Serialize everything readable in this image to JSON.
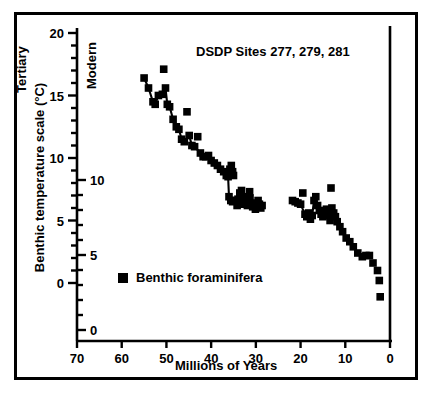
{
  "figure": {
    "title": "DSDP Sites 277, 279, 281",
    "xlabel": "Millions of Years",
    "ylabel": "Benthic temperature scale (°C)",
    "left_era_label": "Tertiary",
    "right_era_label": "Modern",
    "legend_label": "Benthic foraminifera",
    "legend_marker": "filled-square",
    "colors": {
      "ink": "#000000",
      "background": "#ffffff"
    }
  },
  "chart_data": {
    "type": "scatter",
    "title": "DSDP Sites 277, 279, 281",
    "xlabel": "Millions of Years",
    "ylabel": "Benthic temperature scale (°C)",
    "xlim": [
      70,
      0
    ],
    "x_reversed": true,
    "xticks": [
      70,
      60,
      50,
      40,
      30,
      20,
      10,
      0
    ],
    "xticklabels": [
      "70",
      "60",
      "50",
      "40",
      "30",
      "20",
      "10",
      "0"
    ],
    "grid": false,
    "legend_position": "inside-lower-left",
    "annotations": [
      "Tertiary",
      "Modern"
    ],
    "y_axes": [
      {
        "name": "upper-scale",
        "ticks": [
          20,
          15,
          10,
          5,
          0
        ],
        "ticklabels": [
          "20",
          "15",
          "10",
          "5",
          "0"
        ],
        "minor_tick_step": 1,
        "label_side": "left-of-axis",
        "pixel_top_value": 20,
        "pixel_bottom_value": 0
      },
      {
        "name": "lower-scale",
        "ticks": [
          10,
          5,
          0
        ],
        "ticklabels": [
          "10",
          "5",
          "0"
        ],
        "minor_tick_step": 1,
        "label_side": "right-of-axis",
        "pixel_top_value": 10,
        "pixel_bottom_value": 0
      }
    ],
    "series": [
      {
        "name": "Benthic foraminifera",
        "marker": "square",
        "color": "#000000",
        "connected": true,
        "points": [
          [
            55.0,
            16.4
          ],
          [
            54.0,
            15.6
          ],
          [
            53.0,
            14.5
          ],
          [
            52.5,
            14.3
          ],
          [
            51.8,
            15.0
          ],
          [
            50.9,
            15.1
          ],
          [
            50.6,
            17.1
          ],
          [
            50.2,
            15.6
          ],
          [
            49.8,
            14.3
          ],
          [
            49.3,
            14.1
          ],
          [
            48.5,
            13.1
          ],
          [
            47.8,
            12.5
          ],
          [
            47.2,
            12.3
          ],
          [
            46.6,
            11.5
          ],
          [
            46.0,
            11.3
          ],
          [
            45.4,
            13.7
          ],
          [
            44.9,
            11.8
          ],
          [
            44.3,
            11.0
          ],
          [
            43.7,
            10.9
          ],
          [
            43.0,
            11.7
          ],
          [
            42.4,
            10.4
          ],
          [
            41.8,
            10.1
          ],
          [
            41.2,
            10.1
          ],
          [
            40.6,
            10.2
          ],
          [
            40.0,
            9.8
          ],
          [
            39.3,
            9.6
          ],
          [
            38.6,
            9.4
          ],
          [
            37.9,
            9.1
          ],
          [
            37.2,
            8.9
          ],
          [
            36.6,
            8.6
          ],
          [
            36.2,
            8.5
          ],
          [
            35.8,
            9.1
          ],
          [
            35.5,
            9.4
          ],
          [
            35.2,
            8.9
          ],
          [
            35.0,
            8.6
          ],
          [
            36.0,
            6.9
          ],
          [
            35.6,
            6.6
          ],
          [
            35.2,
            6.5
          ],
          [
            34.6,
            6.6
          ],
          [
            34.0,
            6.7
          ],
          [
            33.6,
            7.2
          ],
          [
            33.2,
            7.4
          ],
          [
            32.8,
            6.9
          ],
          [
            32.5,
            6.6
          ],
          [
            32.2,
            6.4
          ],
          [
            31.9,
            6.2
          ],
          [
            31.6,
            6.5
          ],
          [
            31.3,
            6.8
          ],
          [
            31.0,
            6.4
          ],
          [
            30.7,
            6.1
          ],
          [
            30.4,
            6.3
          ],
          [
            30.1,
            5.9
          ],
          [
            29.8,
            6.2
          ],
          [
            29.5,
            6.6
          ],
          [
            29.2,
            6.3
          ],
          [
            28.9,
            6.0
          ],
          [
            28.6,
            6.2
          ],
          [
            31.4,
            7.3
          ],
          [
            33.0,
            6.3
          ],
          [
            34.2,
            6.2
          ],
          [
            21.8,
            6.6
          ],
          [
            21.2,
            6.5
          ],
          [
            20.6,
            6.4
          ],
          [
            20.0,
            6.3
          ],
          [
            19.5,
            7.2
          ],
          [
            19.0,
            5.5
          ],
          [
            18.6,
            5.3
          ],
          [
            18.2,
            5.6
          ],
          [
            17.8,
            5.1
          ],
          [
            17.4,
            5.4
          ],
          [
            17.0,
            6.6
          ],
          [
            16.6,
            6.9
          ],
          [
            16.2,
            6.2
          ],
          [
            15.8,
            5.8
          ],
          [
            15.4,
            5.5
          ],
          [
            15.0,
            5.3
          ],
          [
            14.6,
            5.6
          ],
          [
            14.2,
            5.9
          ],
          [
            13.8,
            5.4
          ],
          [
            13.4,
            5.0
          ],
          [
            13.2,
            7.6
          ],
          [
            13.0,
            6.0
          ],
          [
            12.6,
            5.6
          ],
          [
            12.2,
            5.3
          ],
          [
            11.8,
            4.9
          ],
          [
            11.2,
            4.5
          ],
          [
            10.6,
            4.1
          ],
          [
            9.8,
            3.6
          ],
          [
            9.0,
            3.3
          ],
          [
            8.2,
            2.9
          ],
          [
            7.2,
            2.4
          ],
          [
            6.2,
            2.1
          ],
          [
            5.4,
            2.2
          ],
          [
            4.6,
            2.2
          ],
          [
            3.8,
            1.6
          ],
          [
            2.8,
            1.0
          ],
          [
            2.4,
            0.2
          ],
          [
            2.2,
            -1.1
          ]
        ],
        "paths": [
          [
            [
              55.0,
              16.4
            ],
            [
              54.0,
              15.6
            ],
            [
              53.0,
              14.5
            ],
            [
              52.5,
              14.3
            ],
            [
              51.8,
              15.0
            ],
            [
              50.9,
              15.1
            ],
            [
              50.2,
              15.6
            ],
            [
              49.8,
              14.3
            ],
            [
              49.3,
              14.1
            ],
            [
              48.5,
              13.1
            ],
            [
              47.8,
              12.5
            ],
            [
              47.2,
              12.3
            ],
            [
              46.6,
              11.5
            ],
            [
              46.0,
              11.3
            ],
            [
              44.9,
              11.8
            ],
            [
              44.3,
              11.0
            ],
            [
              43.7,
              10.9
            ],
            [
              42.4,
              10.4
            ],
            [
              41.8,
              10.1
            ],
            [
              41.2,
              10.1
            ],
            [
              40.6,
              10.2
            ],
            [
              40.0,
              9.8
            ],
            [
              39.3,
              9.6
            ],
            [
              38.6,
              9.4
            ],
            [
              37.9,
              9.1
            ],
            [
              37.2,
              8.9
            ],
            [
              36.6,
              8.6
            ],
            [
              36.2,
              8.5
            ],
            [
              35.8,
              9.1
            ],
            [
              35.5,
              9.4
            ],
            [
              35.2,
              8.9
            ],
            [
              35.0,
              8.6
            ]
          ],
          [
            [
              36.2,
              8.5
            ],
            [
              36.0,
              6.9
            ],
            [
              35.6,
              6.6
            ],
            [
              35.2,
              6.5
            ]
          ],
          [
            [
              34.6,
              6.6
            ],
            [
              34.0,
              6.7
            ],
            [
              33.6,
              7.2
            ],
            [
              33.2,
              7.4
            ],
            [
              32.8,
              6.9
            ],
            [
              32.5,
              6.6
            ],
            [
              32.2,
              6.4
            ],
            [
              31.9,
              6.2
            ],
            [
              31.6,
              6.5
            ],
            [
              31.3,
              6.8
            ],
            [
              31.0,
              6.4
            ],
            [
              30.7,
              6.1
            ],
            [
              30.4,
              6.3
            ],
            [
              30.1,
              5.9
            ],
            [
              29.8,
              6.2
            ],
            [
              29.5,
              6.6
            ],
            [
              29.2,
              6.3
            ],
            [
              28.9,
              6.0
            ],
            [
              28.6,
              6.2
            ]
          ],
          [
            [
              21.8,
              6.6
            ],
            [
              21.2,
              6.5
            ],
            [
              20.6,
              6.4
            ],
            [
              20.0,
              6.3
            ],
            [
              19.0,
              5.5
            ],
            [
              18.6,
              5.3
            ],
            [
              18.2,
              5.6
            ],
            [
              17.8,
              5.1
            ],
            [
              17.4,
              5.4
            ],
            [
              17.0,
              6.6
            ],
            [
              16.6,
              6.9
            ],
            [
              16.2,
              6.2
            ],
            [
              15.8,
              5.8
            ],
            [
              15.4,
              5.5
            ],
            [
              15.0,
              5.3
            ],
            [
              14.6,
              5.6
            ],
            [
              14.2,
              5.9
            ],
            [
              13.8,
              5.4
            ],
            [
              13.4,
              5.0
            ],
            [
              13.0,
              6.0
            ],
            [
              12.6,
              5.6
            ],
            [
              12.2,
              5.3
            ],
            [
              11.8,
              4.9
            ],
            [
              11.2,
              4.5
            ],
            [
              10.6,
              4.1
            ],
            [
              9.8,
              3.6
            ],
            [
              9.0,
              3.3
            ],
            [
              8.2,
              2.9
            ]
          ]
        ]
      }
    ]
  }
}
